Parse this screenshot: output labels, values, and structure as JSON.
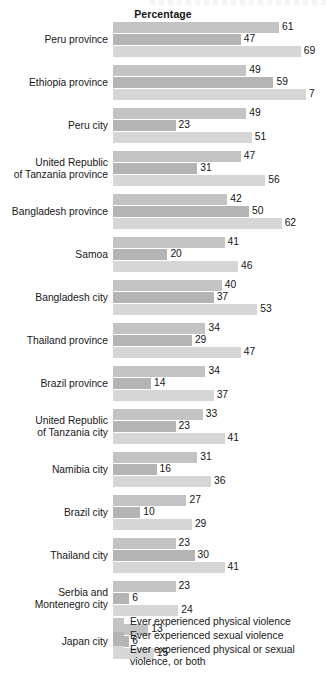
{
  "chart_title": "Percentage",
  "chart_data": {
    "type": "bar",
    "orientation": "horizontal",
    "title": "Percentage",
    "xlabel": "Percentage",
    "ylabel": "",
    "xlim": [
      0,
      78
    ],
    "grid": false,
    "legend_position": "bottom",
    "series": [
      {
        "name": "Ever experienced physical violence",
        "color": "#c3c3c3",
        "values": [
          61,
          49,
          49,
          47,
          42,
          41,
          40,
          34,
          34,
          33,
          31,
          27,
          23,
          23,
          13
        ]
      },
      {
        "name": "Ever experienced sexual violence",
        "color": "#b4b4b4",
        "values": [
          47,
          59,
          23,
          31,
          50,
          20,
          37,
          29,
          14,
          23,
          16,
          10,
          30,
          6,
          6
        ]
      },
      {
        "name": "Ever experienced physical or sexual violence, or both",
        "color": "#d6d6d6",
        "values": [
          69,
          71,
          51,
          56,
          62,
          46,
          53,
          47,
          37,
          41,
          36,
          29,
          41,
          24,
          15
        ]
      }
    ],
    "categories": [
      "Peru province",
      "Ethiopia province",
      "Peru city",
      "United Republic of Tanzania province",
      "Bangladesh province",
      "Samoa",
      "Bangladesh city",
      "Thailand province",
      "Brazil province",
      "United Republic of Tanzania city",
      "Namibia city",
      "Brazil city",
      "Thailand city",
      "Serbia and Montenegro city",
      "Japan city"
    ]
  },
  "rows": [
    {
      "label_lines": [
        "Peru province"
      ],
      "values": [
        61,
        47,
        69
      ],
      "labels": [
        "61",
        "47",
        "69"
      ]
    },
    {
      "label_lines": [
        "Ethiopia province"
      ],
      "values": [
        49,
        59,
        71
      ],
      "labels": [
        "49",
        "59",
        "7"
      ]
    },
    {
      "label_lines": [
        "Peru city"
      ],
      "values": [
        49,
        23,
        51
      ],
      "labels": [
        "49",
        "23",
        "51"
      ]
    },
    {
      "label_lines": [
        "United Republic",
        "of Tanzania province"
      ],
      "values": [
        47,
        31,
        56
      ],
      "labels": [
        "47",
        "31",
        "56"
      ]
    },
    {
      "label_lines": [
        "Bangladesh province"
      ],
      "values": [
        42,
        50,
        62
      ],
      "labels": [
        "42",
        "50",
        "62"
      ]
    },
    {
      "label_lines": [
        "Samoa"
      ],
      "values": [
        41,
        20,
        46
      ],
      "labels": [
        "41",
        "20",
        "46"
      ]
    },
    {
      "label_lines": [
        "Bangladesh city"
      ],
      "values": [
        40,
        37,
        53
      ],
      "labels": [
        "40",
        "37",
        "53"
      ]
    },
    {
      "label_lines": [
        "Thailand province"
      ],
      "values": [
        34,
        29,
        47
      ],
      "labels": [
        "34",
        "29",
        "47"
      ]
    },
    {
      "label_lines": [
        "Brazil province"
      ],
      "values": [
        34,
        14,
        37
      ],
      "labels": [
        "34",
        "14",
        "37"
      ]
    },
    {
      "label_lines": [
        "United Republic",
        "of Tanzania city"
      ],
      "values": [
        33,
        23,
        41
      ],
      "labels": [
        "33",
        "23",
        "41"
      ]
    },
    {
      "label_lines": [
        "Namibia city"
      ],
      "values": [
        31,
        16,
        36
      ],
      "labels": [
        "31",
        "16",
        "36"
      ]
    },
    {
      "label_lines": [
        "Brazil city"
      ],
      "values": [
        27,
        10,
        29
      ],
      "labels": [
        "27",
        "10",
        "29"
      ]
    },
    {
      "label_lines": [
        "Thailand city"
      ],
      "values": [
        23,
        30,
        41
      ],
      "labels": [
        "23",
        "30",
        "41"
      ]
    },
    {
      "label_lines": [
        "Serbia and",
        "Montenegro city"
      ],
      "values": [
        23,
        6,
        24
      ],
      "labels": [
        "23",
        "6",
        "24"
      ]
    },
    {
      "label_lines": [
        "Japan city"
      ],
      "values": [
        13,
        6,
        15
      ],
      "labels": [
        "13",
        "6",
        "15"
      ]
    }
  ],
  "legend": {
    "items": [
      {
        "label": "Ever experienced physical violence",
        "color": "#c3c3c3"
      },
      {
        "label": "Ever experienced sexual violence",
        "color": "#b4b4b4"
      },
      {
        "label": "Ever experienced physical or sexual violence, or both",
        "color": "#d6d6d6"
      }
    ]
  },
  "scale": {
    "px_per_unit": 2.72,
    "bar_origin_x": 113
  }
}
